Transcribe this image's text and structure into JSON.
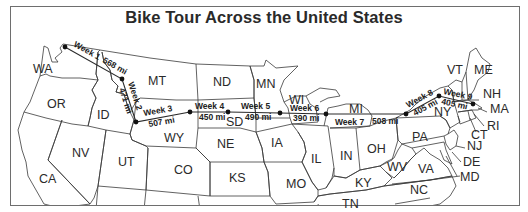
{
  "map": {
    "title": "Bike Tour Across the United States",
    "states": [
      {
        "abbr": "WA",
        "x": 33,
        "y": 73
      },
      {
        "abbr": "OR",
        "x": 47,
        "y": 108
      },
      {
        "abbr": "ID",
        "x": 97,
        "y": 119
      },
      {
        "abbr": "MT",
        "x": 148,
        "y": 85
      },
      {
        "abbr": "ND",
        "x": 213,
        "y": 86
      },
      {
        "abbr": "MN",
        "x": 256,
        "y": 88
      },
      {
        "abbr": "WI",
        "x": 289,
        "y": 104
      },
      {
        "abbr": "MI",
        "x": 349,
        "y": 113
      },
      {
        "abbr": "SD",
        "x": 226,
        "y": 126
      },
      {
        "abbr": "WY",
        "x": 164,
        "y": 142
      },
      {
        "abbr": "NE",
        "x": 217,
        "y": 148
      },
      {
        "abbr": "IA",
        "x": 271,
        "y": 147
      },
      {
        "abbr": "IL",
        "x": 311,
        "y": 163
      },
      {
        "abbr": "IN",
        "x": 340,
        "y": 160
      },
      {
        "abbr": "OH",
        "x": 367,
        "y": 153
      },
      {
        "abbr": "PA",
        "x": 412,
        "y": 141
      },
      {
        "abbr": "NY",
        "x": 434,
        "y": 116
      },
      {
        "abbr": "VT",
        "x": 447,
        "y": 74
      },
      {
        "abbr": "ME",
        "x": 474,
        "y": 74
      },
      {
        "abbr": "NH",
        "x": 483,
        "y": 98
      },
      {
        "abbr": "MA",
        "x": 490,
        "y": 113
      },
      {
        "abbr": "RI",
        "x": 487,
        "y": 130
      },
      {
        "abbr": "CT",
        "x": 471,
        "y": 139
      },
      {
        "abbr": "NJ",
        "x": 467,
        "y": 150
      },
      {
        "abbr": "DE",
        "x": 463,
        "y": 166
      },
      {
        "abbr": "MD",
        "x": 460,
        "y": 181
      },
      {
        "abbr": "VA",
        "x": 418,
        "y": 173
      },
      {
        "abbr": "WV",
        "x": 387,
        "y": 171
      },
      {
        "abbr": "KY",
        "x": 355,
        "y": 187
      },
      {
        "abbr": "NC",
        "x": 410,
        "y": 194
      },
      {
        "abbr": "TN",
        "x": 342,
        "y": 208
      },
      {
        "abbr": "MO",
        "x": 286,
        "y": 188
      },
      {
        "abbr": "KS",
        "x": 229,
        "y": 182
      },
      {
        "abbr": "CO",
        "x": 174,
        "y": 174
      },
      {
        "abbr": "UT",
        "x": 118,
        "y": 166
      },
      {
        "abbr": "NV",
        "x": 72,
        "y": 157
      },
      {
        "abbr": "CA",
        "x": 39,
        "y": 183
      }
    ],
    "route": {
      "stops": [
        {
          "x": 65,
          "y": 47
        },
        {
          "x": 122,
          "y": 79
        },
        {
          "x": 136,
          "y": 122
        },
        {
          "x": 190,
          "y": 112
        },
        {
          "x": 228,
          "y": 112
        },
        {
          "x": 280,
          "y": 113
        },
        {
          "x": 326,
          "y": 114
        },
        {
          "x": 406,
          "y": 114
        },
        {
          "x": 439,
          "y": 96
        },
        {
          "x": 473,
          "y": 104
        }
      ],
      "legs": [
        {
          "week": "Week 1",
          "distance": "568 mi"
        },
        {
          "week": "Week 2",
          "distance": "471 mi"
        },
        {
          "week": "Week 3",
          "distance": "507 mi"
        },
        {
          "week": "Week 4",
          "distance": "450 mi"
        },
        {
          "week": "Week 5",
          "distance": "490 mi"
        },
        {
          "week": "Week 6",
          "distance": "390 mi"
        },
        {
          "week": "Week 7",
          "distance": "508 mi"
        },
        {
          "week": "Week 8",
          "distance": "405 mi"
        },
        {
          "week": "Week 9",
          "distance": "405 mi"
        }
      ]
    }
  }
}
